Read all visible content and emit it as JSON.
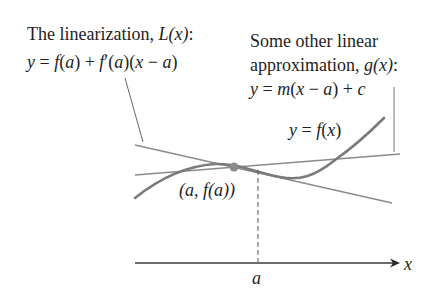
{
  "labels": {
    "linearization_title": "The linearization, ",
    "linearization_symbol": "L(x)",
    "linearization_colon": ":",
    "linearization_eq_parts": [
      "y",
      " = ",
      "f",
      "(",
      "a",
      ") + ",
      "f",
      "′(",
      "a",
      ")(",
      "x",
      " − ",
      "a",
      ")"
    ],
    "other_line1": "Some other linear",
    "other_line2": "approximation, ",
    "other_symbol": "g(x)",
    "other_colon": ":",
    "other_eq_parts": [
      "y",
      " = ",
      "m",
      "(",
      "x",
      " − ",
      "a",
      ") + ",
      "c"
    ],
    "curve_label_parts": [
      "y",
      " = ",
      "f",
      "(",
      "x",
      ")"
    ],
    "point_label": "(a, f(a))",
    "x_axis_label": "x",
    "tick_label": "a"
  },
  "colors": {
    "curve": "#7a7a7a",
    "lines": "#8a8a8a",
    "point": "#8c8c8c",
    "axis": "#3a3a3a",
    "text": "#1e1e1e"
  }
}
